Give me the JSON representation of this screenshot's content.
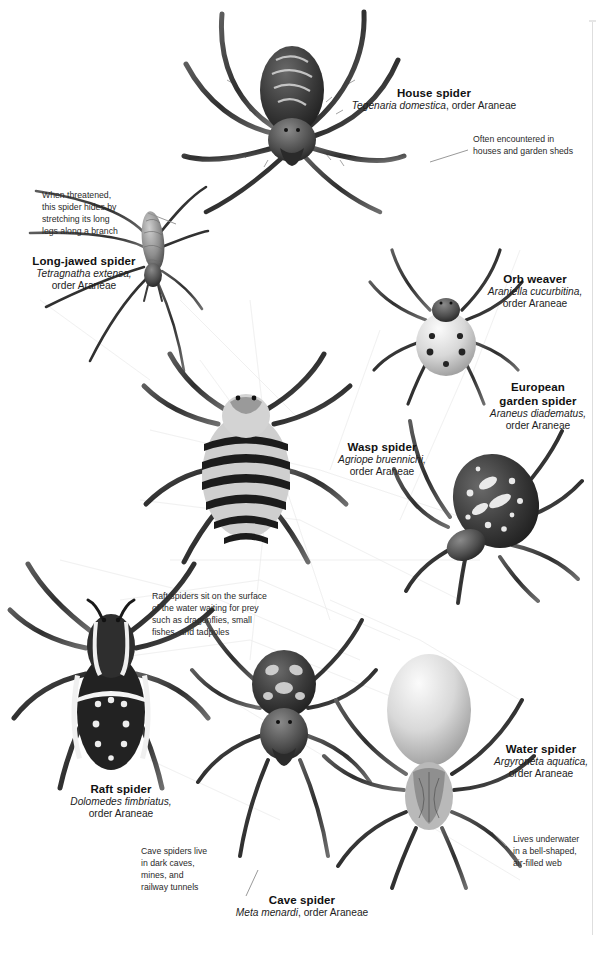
{
  "plate": {
    "title": "Spiders",
    "background": "#ffffff",
    "ink": "#1b1b1b",
    "rule_color": "#dedede"
  },
  "species": [
    {
      "id": "house-spider",
      "common": "House spider",
      "scientific": "Tegenaria domestica,",
      "order": " order Araneae",
      "sci_inline": "Tegenaria domestica",
      "order_inline": ", order Araneae",
      "align": "center"
    },
    {
      "id": "long-jawed-spider",
      "common": "Long-jawed spider",
      "scientific": "Tetragnatha extensa,",
      "order": "order Araneae",
      "align": "center"
    },
    {
      "id": "orb-weaver",
      "common": "Orb weaver",
      "scientific": "Araniella cucurbitina,",
      "order": "order Araneae",
      "align": "center"
    },
    {
      "id": "european-garden-spider",
      "common_line1": "European",
      "common_line2": "garden spider",
      "scientific": "Araneus diadematus,",
      "order": "order Araneae",
      "align": "center"
    },
    {
      "id": "wasp-spider",
      "common": "Wasp spider",
      "scientific": "Agriope bruennichi,",
      "order": "order Araneae",
      "align": "center"
    },
    {
      "id": "raft-spider",
      "common": "Raft spider",
      "scientific": "Dolomedes fimbriatus,",
      "order": "order Araneae",
      "align": "center"
    },
    {
      "id": "water-spider",
      "common": "Water spider",
      "scientific": "Argyroneta aquatica,",
      "order": "order Araneae",
      "align": "center"
    },
    {
      "id": "cave-spider",
      "common": "Cave spider",
      "scientific": "Meta menardi",
      "order": ", order Araneae",
      "align": "center"
    }
  ],
  "annotations": [
    {
      "id": "house-spider-note",
      "lines": [
        "Often encountered in",
        "houses and garden sheds"
      ],
      "text": "Often encountered in houses and garden sheds"
    },
    {
      "id": "long-jawed-spider-note",
      "lines": [
        "When threatened,",
        "this spider hides by",
        "stretching its long",
        "legs along a branch"
      ],
      "text": "When threatened, this spider hides by stretching its long legs along a branch"
    },
    {
      "id": "raft-spider-note",
      "lines": [
        "Raft spiders sit on the surface",
        "of the water waiting for prey",
        "such as dragonflies, small",
        "fishes, and tadpoles"
      ],
      "text": "Raft spiders sit on the surface of the water waiting for prey such as dragonflies, small fishes, and tadpoles"
    },
    {
      "id": "cave-spider-note",
      "lines": [
        "Cave spiders live",
        "in dark caves,",
        "mines, and",
        "railway tunnels"
      ],
      "text": "Cave spiders live in dark caves, mines, and railway tunnels"
    },
    {
      "id": "water-spider-note",
      "lines": [
        "Lives underwater",
        "in a bell-shaped,",
        "air-filled web"
      ],
      "text": "Lives underwater in a bell-shaped, air-filled web"
    }
  ]
}
